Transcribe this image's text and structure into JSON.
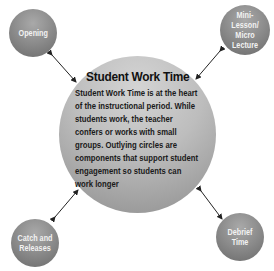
{
  "center": {
    "title": "Student Work Time",
    "body": "Student Work Time is at the heart of the instructional period. While students work, the teacher confers or works with small groups. Outlying circles are components that support student engagement so students can work longer"
  },
  "satellites": {
    "top_left": "Opening",
    "top_right": "Mini-Lesson/ Micro Lecture",
    "bottom_left": "Catch and Releases",
    "bottom_right": "Debrief Time"
  },
  "colors": {
    "center_fill": "#bdbdbd",
    "satellite_fill": "#8a8a8a",
    "arrow": "#222222"
  }
}
